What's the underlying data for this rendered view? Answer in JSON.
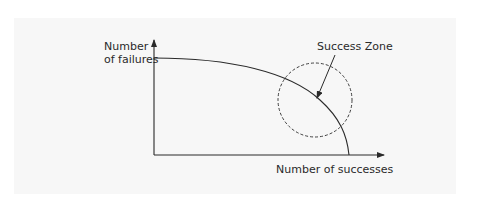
{
  "diagram": {
    "y_axis_label_line1": "Number",
    "y_axis_label_line2": "of failures",
    "x_axis_label": "Number of successes",
    "zone_label": "Success Zone",
    "elements": [
      {
        "type": "axis",
        "name": "y-axis",
        "direction": "up"
      },
      {
        "type": "axis",
        "name": "x-axis",
        "direction": "right"
      },
      {
        "type": "curve",
        "name": "tradeoff-curve",
        "description": "concave curve from high failures/zero successes down to zero failures/max successes"
      },
      {
        "type": "dashed-circle",
        "name": "success-zone",
        "description": "dashed circle on the curve near its steep portion"
      },
      {
        "type": "arrow",
        "name": "zone-pointer",
        "from": "Success Zone label",
        "to": "curve inside circle"
      }
    ],
    "colors": {
      "page_background": "#ffffff",
      "panel_background": "#f7f7f7",
      "stroke": "#2a2a2a",
      "text": "#2a2a2a"
    }
  }
}
